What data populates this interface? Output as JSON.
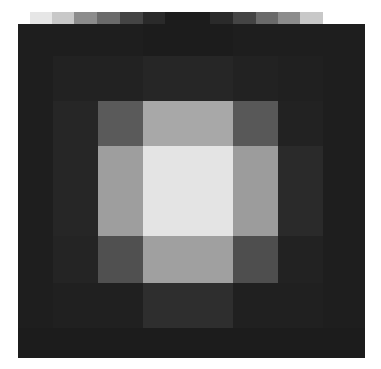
{
  "chart_data": {
    "type": "heatmap",
    "title": "",
    "xlabel": "",
    "ylabel": "",
    "colormap": "grayscale",
    "top_strip": {
      "description": "grayscale gradient strip above the grid",
      "segment_widths": [
        22,
        22,
        23,
        23,
        23,
        22,
        45,
        23,
        23,
        22,
        22,
        23
      ],
      "colors": [
        "#e6e6e6",
        "#c8c8c8",
        "#8c8c8c",
        "#6a6a6a",
        "#444444",
        "#2a2a2a",
        "#1c1c1c",
        "#2a2a2a",
        "#444444",
        "#6a6a6a",
        "#8c8c8c",
        "#c8c8c8"
      ]
    },
    "col_widths": [
      35,
      45,
      45,
      45,
      45,
      45,
      45,
      42
    ],
    "row_heights": [
      32,
      45,
      45,
      45,
      45,
      47,
      45,
      30
    ],
    "grid_colors": [
      [
        "#1e1e1e",
        "#1e1e1e",
        "#1e1e1e",
        "#1c1c1c",
        "#1c1c1c",
        "#1e1e1e",
        "#1e1e1e",
        "#1e1e1e"
      ],
      [
        "#1e1e1e",
        "#222222",
        "#222222",
        "#262626",
        "#262626",
        "#222222",
        "#202020",
        "#1e1e1e"
      ],
      [
        "#1e1e1e",
        "#262626",
        "#5a5a5a",
        "#a8a8a8",
        "#a8a8a8",
        "#585858",
        "#222222",
        "#1e1e1e"
      ],
      [
        "#1e1e1e",
        "#262626",
        "#9e9e9e",
        "#e4e4e4",
        "#e4e4e4",
        "#9c9c9c",
        "#2a2a2a",
        "#1e1e1e"
      ],
      [
        "#1e1e1e",
        "#262626",
        "#9e9e9e",
        "#e4e4e4",
        "#e4e4e4",
        "#9c9c9c",
        "#2a2a2a",
        "#1e1e1e"
      ],
      [
        "#1e1e1e",
        "#242424",
        "#505050",
        "#a0a0a0",
        "#a0a0a0",
        "#4e4e4e",
        "#222222",
        "#1e1e1e"
      ],
      [
        "#1e1e1e",
        "#202020",
        "#202020",
        "#2e2e2e",
        "#2e2e2e",
        "#202020",
        "#202020",
        "#1e1e1e"
      ],
      [
        "#1c1c1c",
        "#1c1c1c",
        "#1c1c1c",
        "#1c1c1c",
        "#1c1c1c",
        "#1c1c1c",
        "#1c1c1c",
        "#1c1c1c"
      ]
    ],
    "grid_values": [
      [
        30,
        30,
        30,
        28,
        28,
        30,
        30,
        30
      ],
      [
        30,
        34,
        34,
        38,
        38,
        34,
        32,
        30
      ],
      [
        30,
        38,
        90,
        168,
        168,
        88,
        34,
        30
      ],
      [
        30,
        38,
        158,
        228,
        228,
        156,
        42,
        30
      ],
      [
        30,
        38,
        158,
        228,
        228,
        156,
        42,
        30
      ],
      [
        30,
        36,
        80,
        160,
        160,
        78,
        34,
        30
      ],
      [
        30,
        32,
        32,
        46,
        46,
        32,
        32,
        30
      ],
      [
        28,
        28,
        28,
        28,
        28,
        28,
        28,
        28
      ]
    ],
    "value_range": [
      0,
      255
    ]
  }
}
